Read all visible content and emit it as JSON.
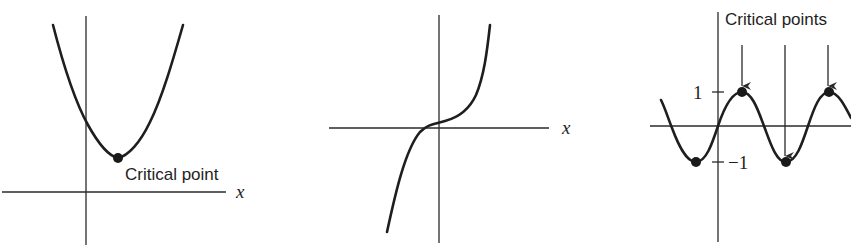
{
  "panels": [
    {
      "id": "parabola",
      "x_axis_label": "x",
      "annotation": "Critical point",
      "description": "Upward parabola with a single minimum"
    },
    {
      "id": "cubic",
      "x_axis_label": "x",
      "description": "Increasing cubic-like curve with no critical point"
    },
    {
      "id": "sine",
      "annotation": "Critical points",
      "tick_labels": [
        "1",
        "−1"
      ],
      "description": "Sine wave with maxima at 1 and minima at -1"
    }
  ],
  "colors": {
    "ink": "#1e1e1e",
    "background": "#ffffff"
  }
}
